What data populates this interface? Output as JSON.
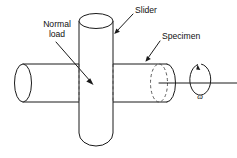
{
  "figure": {
    "kind": "engineering-schematic",
    "background_color": "#ffffff",
    "line_color": "#1a1a1a",
    "hidden_line_color": "#4a4a4a"
  },
  "labels": {
    "normal_load_line1": "Normal",
    "normal_load_line2": "load",
    "slider": "Slider",
    "specimen": "Specimen",
    "angular_velocity": "ω"
  },
  "parts": {
    "specimen_cylinder": {
      "name": "Specimen",
      "orientation": "horizontal",
      "description": "long horizontal cylinder with visible elliptical end face at left and hidden dashed ellipse at right"
    },
    "slider_cylinder": {
      "name": "Slider",
      "orientation": "vertical",
      "description": "vertical cylinder with open elliptical top and rounded bottom, pressed against the specimen"
    },
    "rotation_indicator": {
      "name": "angular velocity arrow",
      "symbol": "ω",
      "direction": "counterclockwise about the specimen axis",
      "description": "circular arrow encircling the horizontal rotation axis line"
    },
    "rotation_axis": {
      "name": "axis of rotation",
      "description": "horizontal centerline extending to the right of the specimen"
    }
  },
  "leaders": [
    {
      "id": "normal-load",
      "label_ref": "normal_load",
      "points_to": "slider-specimen contact region"
    },
    {
      "id": "slider",
      "label_ref": "slider",
      "points_to": "vertical slider cylinder surface"
    },
    {
      "id": "specimen",
      "label_ref": "specimen",
      "points_to": "horizontal specimen cylinder surface"
    }
  ]
}
